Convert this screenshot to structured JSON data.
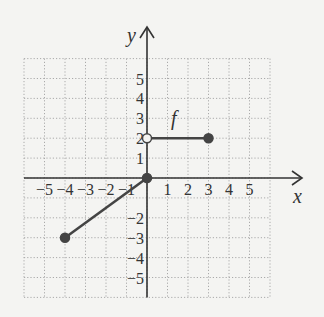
{
  "chart_data": {
    "type": "line",
    "title": "",
    "xlabel": "x",
    "ylabel": "y",
    "function_label": "f",
    "xlim": [
      -6,
      6
    ],
    "ylim": [
      -6,
      6
    ],
    "grid": true,
    "x_ticks": [
      -5,
      -4,
      -3,
      -2,
      -1,
      1,
      2,
      3,
      4,
      5
    ],
    "y_ticks": [
      5,
      4,
      3,
      2,
      1,
      -2,
      -3,
      -4,
      -5
    ],
    "x_tick_labels": [
      "−5",
      "−4",
      "−3",
      "−2",
      "−1",
      "1",
      "2",
      "3",
      "4",
      "5"
    ],
    "y_tick_labels": [
      "5",
      "4",
      "3",
      "2",
      "1",
      "−2",
      "−3",
      "−4",
      "−5"
    ],
    "series": [
      {
        "name": "f segment 1",
        "points": [
          [
            -4,
            -3
          ],
          [
            0,
            0
          ]
        ],
        "endpoints": [
          {
            "x": -4,
            "y": -3,
            "closed": true
          },
          {
            "x": 0,
            "y": 0,
            "closed": true
          }
        ]
      },
      {
        "name": "f segment 2",
        "points": [
          [
            0,
            2
          ],
          [
            3,
            2
          ]
        ],
        "endpoints": [
          {
            "x": 0,
            "y": 2,
            "closed": false
          },
          {
            "x": 3,
            "y": 2,
            "closed": true
          }
        ]
      }
    ],
    "colors": {
      "axis": "#333333",
      "curve": "#444444",
      "grid": "#aaaaaa",
      "point": "#444444"
    }
  }
}
